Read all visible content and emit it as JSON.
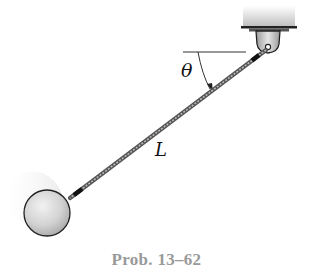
{
  "figure": {
    "caption": "Prob. 13–62",
    "labels": {
      "angle": "θ",
      "length": "L"
    },
    "components": {
      "support": "ceiling-mounted pin bracket",
      "rod": "slender rod of length L",
      "bob": "spherical ball"
    },
    "colors": {
      "caption": "#9a9a9a",
      "outline": "#222222",
      "ball_fill": "#cfcfcf",
      "rod": "#8a8a8a"
    }
  }
}
